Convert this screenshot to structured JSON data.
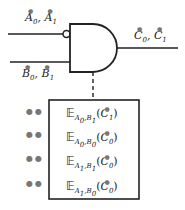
{
  "diagram": {
    "type": "logic-gate",
    "gate": "AND",
    "inverted_input": "top",
    "inputs": [
      {
        "id": "A",
        "label_parts": [
          {
            "var": "A",
            "sub": "0"
          },
          {
            "var": "A",
            "sub": "1"
          }
        ],
        "label_text": "A0*, A1*"
      },
      {
        "id": "B",
        "label_parts": [
          {
            "var": "B",
            "sub": "0"
          },
          {
            "var": "B",
            "sub": "1"
          }
        ],
        "label_text": "B0*, B1*"
      }
    ],
    "output": {
      "id": "C",
      "label_text": "C0*, C1*"
    },
    "marker_symbol": "●",
    "separator": ",",
    "expectation_symbol": "𝔼",
    "table": {
      "rows": [
        {
          "sub1": "A",
          "sub1i": "0",
          "sub2": "B",
          "sub2i": "1",
          "arg": "C",
          "argi": "1",
          "dots": "●●"
        },
        {
          "sub1": "A",
          "sub1i": "0",
          "sub2": "B",
          "sub2i": "0",
          "arg": "C",
          "argi": "0",
          "dots": "●●"
        },
        {
          "sub1": "A",
          "sub1i": "1",
          "sub2": "B",
          "sub2i": "1",
          "arg": "C",
          "argi": "0",
          "dots": "●●"
        },
        {
          "sub1": "A",
          "sub1i": "1",
          "sub2": "B",
          "sub2i": "0",
          "arg": "C",
          "argi": "0",
          "dots": "●●"
        }
      ]
    },
    "colors": {
      "line": "#222222",
      "marker": "#777777",
      "background": "#ffffff"
    }
  }
}
